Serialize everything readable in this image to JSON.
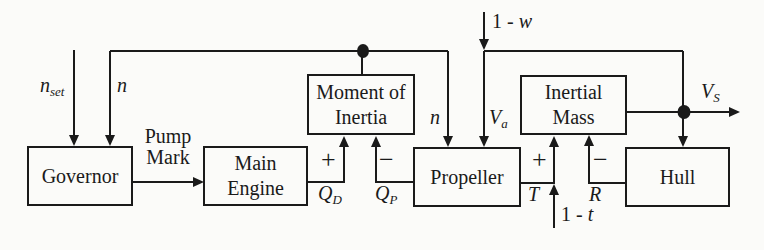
{
  "blocks": {
    "governor": "Governor",
    "main_engine": "Main Engine",
    "moment_of_inertia": "Moment of Inertia",
    "propeller": "Propeller",
    "inertial_mass": "Inertial Mass",
    "hull": "Hull"
  },
  "labels": {
    "n_set": {
      "base": "n",
      "sub": "set"
    },
    "n_governor": "n",
    "pump_mark": "Pump Mark",
    "q_d": {
      "base": "Q",
      "sub": "D"
    },
    "q_p": {
      "base": "Q",
      "sub": "P"
    },
    "n_propeller": "n",
    "v_a": {
      "base": "V",
      "sub": "a"
    },
    "one_minus_w": {
      "prefix": "1 -",
      "var": "w"
    },
    "t_thrust": "T",
    "one_minus_t": {
      "prefix": "1 -",
      "var": "t"
    },
    "r_resistance": "R",
    "v_s": {
      "base": "V",
      "sub": "S"
    }
  },
  "signs": {
    "qd": "+",
    "qp": "−",
    "t": "+",
    "r": "−"
  },
  "colors": {
    "line": "#1a1a1a",
    "background": "#fbfbf9"
  }
}
